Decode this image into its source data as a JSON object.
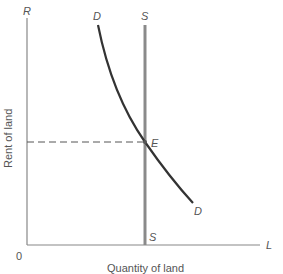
{
  "diagram": {
    "type": "supply-demand",
    "axes": {
      "y_label": "Rent of land",
      "y_end_label": "R",
      "x_label": "Quantity of land",
      "x_end_label": "L",
      "origin_label": "0"
    },
    "curves": {
      "demand": {
        "label_top": "D",
        "label_bottom": "D"
      },
      "supply": {
        "label_top": "S",
        "label_bottom": "S"
      }
    },
    "equilibrium": {
      "label": "E"
    },
    "colors": {
      "axis": "#888888",
      "demand": "#333333",
      "supply": "#8a8a8a",
      "dashed": "#555555"
    }
  }
}
